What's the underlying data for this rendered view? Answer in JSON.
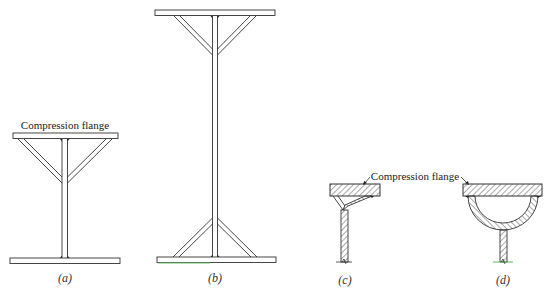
{
  "figure": {
    "panels": [
      {
        "id": "a",
        "caption": "(a)",
        "annotation": "Compression flange",
        "description": "Thin web with inclined braces to top flange"
      },
      {
        "id": "b",
        "caption": "(b)",
        "description": "Tall thin web with inclined braces at top and bottom flanges"
      },
      {
        "id": "c",
        "caption": "(c)",
        "annotation": "Compression flange",
        "description": "Section with Y-shaped stiffener under flange"
      },
      {
        "id": "d",
        "caption": "(d)",
        "description": "Section with semicircular stiffener under flange"
      }
    ],
    "colors": {
      "line": "#333333",
      "hatch": "#555555",
      "accent_green": "#4caf50"
    }
  }
}
